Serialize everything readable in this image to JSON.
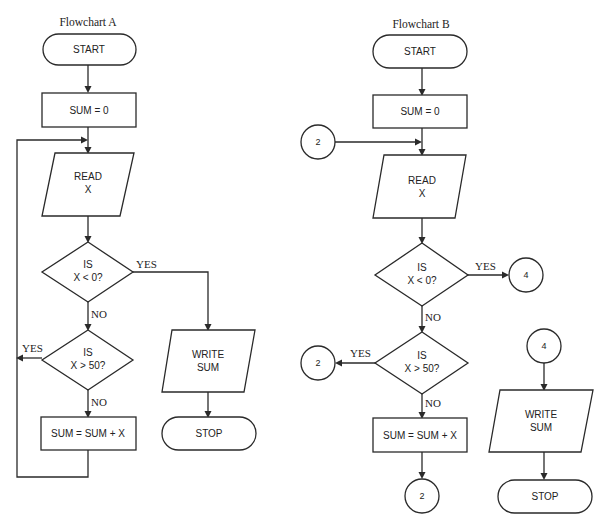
{
  "flowchart_a": {
    "title": "Flowchart A",
    "start": "START",
    "init": "SUM = 0",
    "read_line1": "READ",
    "read_line2": "X",
    "decision1_line1": "IS",
    "decision1_line2": "X < 0?",
    "decision1_yes": "YES",
    "decision1_no": "NO",
    "decision2_line1": "IS",
    "decision2_line2": "X > 50?",
    "decision2_yes": "YES",
    "decision2_no": "NO",
    "process": "SUM = SUM + X",
    "write_line1": "WRITE",
    "write_line2": "SUM",
    "stop": "STOP"
  },
  "flowchart_b": {
    "title": "Flowchart B",
    "start": "START",
    "init": "SUM = 0",
    "connector_in": "2",
    "read_line1": "READ",
    "read_line2": "X",
    "decision1_line1": "IS",
    "decision1_line2": "X < 0?",
    "decision1_yes": "YES",
    "decision1_yes_connector": "4",
    "decision1_no": "NO",
    "decision2_line1": "IS",
    "decision2_line2": "X > 50?",
    "decision2_yes": "YES",
    "decision2_yes_connector": "2",
    "decision2_no": "NO",
    "process": "SUM = SUM + X",
    "process_out_connector": "2",
    "write_in_connector": "4",
    "write_line1": "WRITE",
    "write_line2": "SUM",
    "stop": "STOP"
  }
}
